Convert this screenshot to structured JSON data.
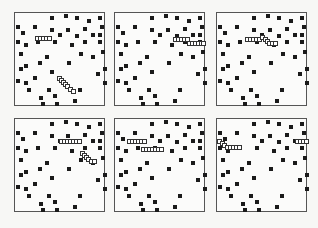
{
  "figure": {
    "panel_count": 6,
    "colors": {
      "background": "#f7f7f5",
      "frame": "#555555",
      "dot": "#1a1a1a",
      "segment_border": "#333333",
      "segment_fill": "#ffffff"
    },
    "panel_size": [
      91,
      94
    ],
    "panels": [
      {
        "id": "p1",
        "origin": [
          14,
          12
        ]
      },
      {
        "id": "p2",
        "origin": [
          114,
          12
        ]
      },
      {
        "id": "p3",
        "origin": [
          216,
          12
        ]
      },
      {
        "id": "p4",
        "origin": [
          14,
          118
        ]
      },
      {
        "id": "p5",
        "origin": [
          114,
          118
        ]
      },
      {
        "id": "p6",
        "origin": [
          216,
          118
        ]
      }
    ],
    "dots": [
      [
        36,
        4
      ],
      [
        50,
        2
      ],
      [
        61,
        4
      ],
      [
        73,
        7
      ],
      [
        84,
        4
      ],
      [
        2,
        13
      ],
      [
        19,
        13
      ],
      [
        36,
        16
      ],
      [
        52,
        16
      ],
      [
        69,
        15
      ],
      [
        86,
        13
      ],
      [
        7,
        19
      ],
      [
        44,
        21
      ],
      [
        61,
        22
      ],
      [
        77,
        21
      ],
      [
        84,
        21
      ],
      [
        2,
        28
      ],
      [
        10,
        31
      ],
      [
        22,
        28
      ],
      [
        39,
        28
      ],
      [
        56,
        31
      ],
      [
        69,
        28
      ],
      [
        84,
        28
      ],
      [
        5,
        40
      ],
      [
        31,
        43
      ],
      [
        65,
        40
      ],
      [
        77,
        43
      ],
      [
        87,
        38
      ],
      [
        24,
        49
      ],
      [
        53,
        49
      ],
      [
        5,
        55
      ],
      [
        10,
        52
      ],
      [
        82,
        60
      ],
      [
        89,
        55
      ],
      [
        2,
        67
      ],
      [
        10,
        69
      ],
      [
        19,
        64
      ],
      [
        36,
        58
      ],
      [
        13,
        76
      ],
      [
        33,
        76
      ],
      [
        64,
        76
      ],
      [
        89,
        69
      ],
      [
        25,
        84
      ],
      [
        39,
        82
      ],
      [
        59,
        87
      ],
      [
        27,
        90
      ],
      [
        41,
        90
      ]
    ],
    "segments": {
      "p1": [
        [
          20,
          23
        ],
        [
          23,
          23
        ],
        [
          26,
          23
        ],
        [
          29,
          23
        ],
        [
          32,
          23
        ],
        [
          42,
          63
        ],
        [
          44,
          65
        ],
        [
          46,
          67
        ],
        [
          48,
          69
        ],
        [
          50,
          71
        ],
        [
          53,
          74
        ],
        [
          56,
          76
        ]
      ],
      "p2": [
        [
          58,
          24
        ],
        [
          61,
          24
        ],
        [
          64,
          24
        ],
        [
          67,
          24
        ],
        [
          70,
          24
        ],
        [
          72,
          28
        ],
        [
          75,
          28
        ],
        [
          78,
          28
        ],
        [
          81,
          28
        ],
        [
          84,
          28
        ],
        [
          86,
          28
        ]
      ],
      "p3": [
        [
          28,
          24
        ],
        [
          31,
          24
        ],
        [
          34,
          24
        ],
        [
          37,
          24
        ],
        [
          40,
          24
        ],
        [
          43,
          22
        ],
        [
          46,
          24
        ],
        [
          48,
          26
        ],
        [
          50,
          28
        ],
        [
          53,
          28
        ],
        [
          56,
          28
        ]
      ],
      "p4": [
        [
          44,
          20
        ],
        [
          47,
          20
        ],
        [
          50,
          20
        ],
        [
          53,
          20
        ],
        [
          56,
          20
        ],
        [
          59,
          20
        ],
        [
          62,
          20
        ],
        [
          65,
          32
        ],
        [
          67,
          34
        ],
        [
          69,
          36
        ],
        [
          71,
          38
        ],
        [
          74,
          40
        ],
        [
          77,
          40
        ]
      ],
      "p5": [
        [
          12,
          20
        ],
        [
          15,
          20
        ],
        [
          18,
          20
        ],
        [
          21,
          20
        ],
        [
          24,
          20
        ],
        [
          27,
          20
        ],
        [
          26,
          28
        ],
        [
          29,
          28
        ],
        [
          32,
          28
        ],
        [
          35,
          28
        ],
        [
          38,
          28
        ],
        [
          41,
          28
        ],
        [
          44,
          28
        ]
      ],
      "p6": [
        [
          0,
          20
        ],
        [
          3,
          22
        ],
        [
          5,
          24
        ],
        [
          8,
          26
        ],
        [
          11,
          26
        ],
        [
          14,
          26
        ],
        [
          17,
          26
        ],
        [
          20,
          26
        ],
        [
          78,
          20
        ],
        [
          81,
          20
        ],
        [
          84,
          20
        ],
        [
          87,
          20
        ]
      ]
    }
  }
}
